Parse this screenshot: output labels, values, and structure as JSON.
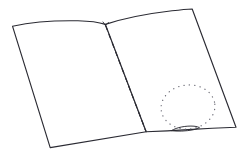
{
  "image": {
    "title": "Open book line drawing",
    "description": "Hand-drawn outline of an open book or folder seen at an angle, with a dashed center fold line and a dotted circular annotation on the right page",
    "width": 244,
    "height": 156,
    "background_color": "#ffffff",
    "ink_color": "#2b2b33",
    "dotted_color": "#6e6e78"
  },
  "shapes": {
    "left_page": {
      "name": "left-page",
      "label": "Left page",
      "fill": "#ffffff",
      "stroke": "#2b2b33",
      "path": "M 12.5 26.2 C 33 21.8 58 20.4 78 20.8 C 90 21.1 99 22.4 105.4 24.4 L 146.2 131.8 L 50.2 147.6 Z"
    },
    "right_page": {
      "name": "right-page",
      "label": "Right page",
      "fill": "#ffffff",
      "stroke": "#2b2b33",
      "path": "M 105.4 24.4 C 124 18.2 150 13.4 172 10.8 C 181 9.8 188 9.2 192.2 9.0 L 236.0 127.2 C 222 127.6 205 128.4 188 129.6 C 172 130.7 157 131.4 146.2 131.8 Z"
    },
    "spine_fold": {
      "name": "spine-fold-line",
      "label": "Center fold (dashed)",
      "stroke": "#2b2b33",
      "style": "dashed",
      "path": "M 105.6 25.6 L 146.0 131.4"
    },
    "dotted_circle": {
      "name": "dotted-circle-annotation",
      "label": "Dotted circular annotation",
      "stroke": "#6e6e78",
      "style": "dotted",
      "cx": 188,
      "cy": 107,
      "rx": 27,
      "ry": 22,
      "rotation": -6
    },
    "bottom_loop": {
      "name": "bottom-edge-loop",
      "label": "Small lens shape on bottom edge",
      "stroke": "#2b2b33",
      "path_upper": "M 171.5 130.6 C 177 127.2 186 125.6 194 126.2 C 197 126.5 198.6 127.0 199.2 127.6",
      "path_lower": "M 171.5 130.6 C 177 131.6 186 131.2 193 129.8 C 196.6 129.0 198.4 128.3 199.2 127.6"
    },
    "spine_notch": {
      "name": "spine-top-notch",
      "label": "Notch where pages meet at top",
      "stroke": "#2b2b33",
      "path": "M 103.0 22.0 L 105.4 25.4 L 108.4 22.4"
    }
  },
  "layers": [
    {
      "id": "left-page",
      "label": "Left page"
    },
    {
      "id": "right-page",
      "label": "Right page"
    },
    {
      "id": "spine-fold-line",
      "label": "Dashed fold"
    },
    {
      "id": "dotted-circle-annotation",
      "label": "Dotted circle"
    },
    {
      "id": "bottom-edge-loop",
      "label": "Bottom loop"
    }
  ]
}
